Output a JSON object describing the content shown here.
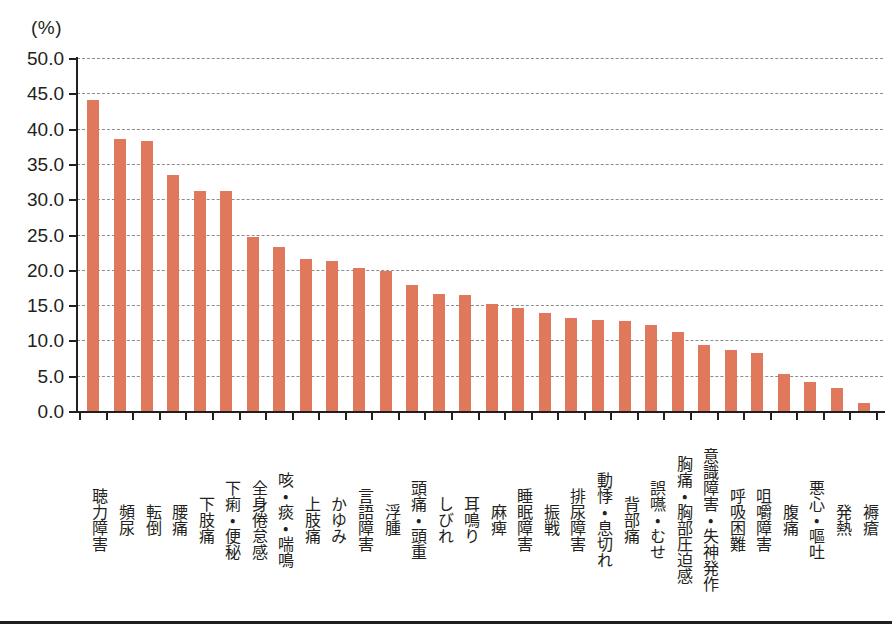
{
  "chart_data": {
    "type": "bar",
    "title": "",
    "subtitle": "",
    "unit_label": "(%)",
    "xlabel": "",
    "ylabel": "",
    "ylim": [
      0,
      50
    ],
    "ytick_step": 5,
    "grid": true,
    "grid_style": "dashed-horizontal",
    "legend": "none",
    "bar_color": "#e0785c",
    "axis_color": "#231f20",
    "grid_color": "#8c8c8c",
    "ytick_labels": [
      "50.0",
      "45.0",
      "40.0",
      "35.0",
      "30.0",
      "25.0",
      "20.0",
      "15.0",
      "10.0",
      "5.0",
      "0.0"
    ],
    "yticks": [
      50.0,
      45.0,
      40.0,
      35.0,
      30.0,
      25.0,
      20.0,
      15.0,
      10.0,
      5.0,
      0.0
    ],
    "categories": [
      "聴力障害",
      "頻尿",
      "転倒",
      "腰痛",
      "下肢痛",
      "下痢・便秘",
      "全身倦怠感",
      "咳・痰・喘鳴",
      "上肢痛",
      "かゆみ",
      "言語障害",
      "浮腫",
      "頭痛・頭重",
      "しびれ",
      "耳鳴り",
      "麻痺",
      "睡眠障害",
      "振戦",
      "排尿障害",
      "動悸・息切れ",
      "背部痛",
      "誤嚥・むせ",
      "胸痛・胸部圧迫感",
      "意識障害・失神発作",
      "呼吸困難",
      "咀嚼障害",
      "腹痛",
      "悪心・嘔吐",
      "発熱",
      "褥瘡"
    ],
    "values": [
      44.0,
      38.5,
      38.2,
      33.4,
      31.2,
      31.1,
      24.7,
      23.2,
      21.5,
      21.2,
      20.3,
      19.8,
      17.8,
      16.6,
      16.5,
      15.2,
      14.6,
      13.9,
      13.2,
      12.9,
      12.8,
      12.2,
      11.2,
      9.4,
      8.6,
      8.2,
      5.2,
      4.1,
      3.2,
      1.2
    ]
  }
}
